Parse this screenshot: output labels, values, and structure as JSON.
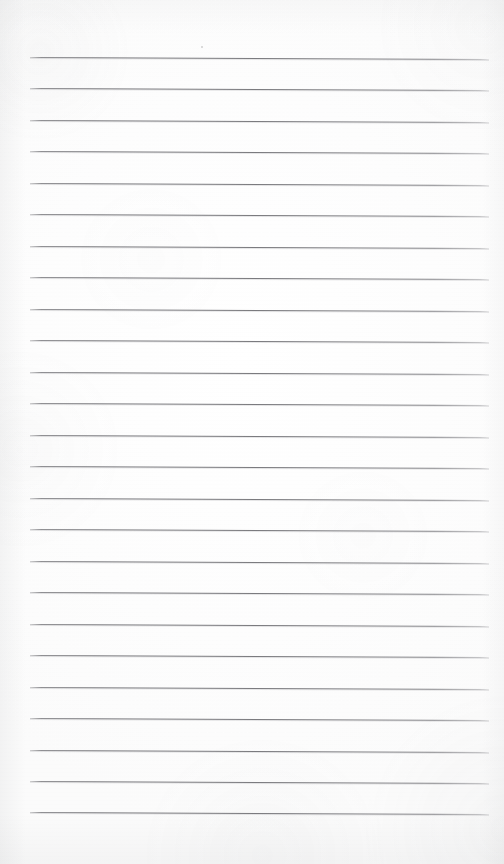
{
  "document": {
    "type": "scanned-lined-paper",
    "title": "Blank Ruled Notebook Page",
    "page_width": 504,
    "page_height": 864,
    "orientation": "portrait",
    "content_text": "",
    "handwriting_present": "none",
    "printed_text_present": "none"
  },
  "paper": {
    "background_color": "#fdfdfd",
    "base_tint_color": "#fafafa",
    "texture_color": "#96989c",
    "edge_shadow_color": "#92949 8",
    "margin_left_px": 30,
    "margin_right_px": 16
  },
  "rules": {
    "label": "Ruled horizontal writing lines",
    "count": 25,
    "color": "#787a7e",
    "thickness_px": 1,
    "first_line_y": 57,
    "spacing_px": 31.45,
    "x_start": 30,
    "x_end": 489,
    "skew_degrees": 0.26,
    "lines": [
      {
        "index": 1,
        "y": 57,
        "x_start": 30,
        "x_end": 489
      },
      {
        "index": 2,
        "y": 88,
        "x_start": 30,
        "x_end": 489
      },
      {
        "index": 3,
        "y": 120,
        "x_start": 30,
        "x_end": 489
      },
      {
        "index": 4,
        "y": 151,
        "x_start": 30,
        "x_end": 489
      },
      {
        "index": 5,
        "y": 183,
        "x_start": 30,
        "x_end": 489
      },
      {
        "index": 6,
        "y": 214,
        "x_start": 30,
        "x_end": 489
      },
      {
        "index": 7,
        "y": 246,
        "x_start": 30,
        "x_end": 489
      },
      {
        "index": 8,
        "y": 277,
        "x_start": 30,
        "x_end": 489
      },
      {
        "index": 9,
        "y": 309,
        "x_start": 30,
        "x_end": 489
      },
      {
        "index": 10,
        "y": 340,
        "x_start": 30,
        "x_end": 489
      },
      {
        "index": 11,
        "y": 372,
        "x_start": 30,
        "x_end": 489
      },
      {
        "index": 12,
        "y": 403,
        "x_start": 30,
        "x_end": 489
      },
      {
        "index": 13,
        "y": 435,
        "x_start": 30,
        "x_end": 489
      },
      {
        "index": 14,
        "y": 466,
        "x_start": 30,
        "x_end": 489
      },
      {
        "index": 15,
        "y": 498,
        "x_start": 30,
        "x_end": 489
      },
      {
        "index": 16,
        "y": 529,
        "x_start": 30,
        "x_end": 489
      },
      {
        "index": 17,
        "y": 561,
        "x_start": 30,
        "x_end": 489
      },
      {
        "index": 18,
        "y": 592,
        "x_start": 30,
        "x_end": 489
      },
      {
        "index": 19,
        "y": 624,
        "x_start": 30,
        "x_end": 489
      },
      {
        "index": 20,
        "y": 655,
        "x_start": 30,
        "x_end": 489
      },
      {
        "index": 21,
        "y": 687,
        "x_start": 30,
        "x_end": 489
      },
      {
        "index": 22,
        "y": 718,
        "x_start": 30,
        "x_end": 489
      },
      {
        "index": 23,
        "y": 750,
        "x_start": 30,
        "x_end": 489
      },
      {
        "index": 24,
        "y": 781,
        "x_start": 30,
        "x_end": 489
      },
      {
        "index": 25,
        "y": 812,
        "x_start": 30,
        "x_end": 489
      }
    ]
  },
  "artifacts": {
    "specks": [
      {
        "x": 201,
        "y": 46
      }
    ]
  }
}
